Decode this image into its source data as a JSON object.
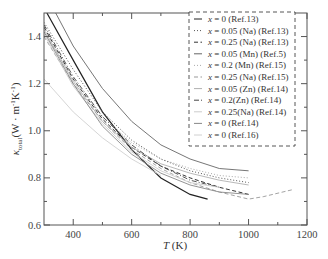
{
  "chart_data": {
    "type": "line",
    "title": "",
    "xlabel": "T (K)",
    "xlabel_italic": "T",
    "xlabel_unit": " (K)",
    "ylabel": "κ_total (W·m⁻¹K⁻¹)",
    "ylabel_parts": {
      "kappa": "κ",
      "sub": "total",
      "unit": "(W · m",
      "exp1": "-1",
      "k": "K",
      "exp2": "-1",
      "close": ")"
    },
    "xlim": [
      300,
      1200
    ],
    "ylim": [
      0.6,
      1.5
    ],
    "xticks": [
      400,
      600,
      800,
      1000,
      1200
    ],
    "xminor": [
      500,
      700,
      900,
      1100
    ],
    "yticks": [
      0.6,
      0.8,
      1.0,
      1.2,
      1.4
    ],
    "yminor": [
      0.7,
      0.9,
      1.1,
      1.3
    ],
    "grid": false,
    "legend_position": "upper right (dashed box)",
    "series": [
      {
        "name": "x = 0 (Ref.13)",
        "style": "solid",
        "color": "#222222",
        "width": 1.2,
        "x": [
          310,
          400,
          500,
          600,
          700,
          800,
          860
        ],
        "y": [
          1.5,
          1.3,
          1.08,
          0.92,
          0.8,
          0.73,
          0.71
        ]
      },
      {
        "name": "x = 0.05 (Na) (Ref.13)",
        "style": "dotted",
        "color": "#555555",
        "width": 1.0,
        "x": [
          300,
          400,
          500,
          600,
          700,
          800,
          900,
          1000
        ],
        "y": [
          1.46,
          1.26,
          1.08,
          0.96,
          0.88,
          0.83,
          0.8,
          0.78
        ]
      },
      {
        "name": "x = 0.25 (Na) (Ref.13)",
        "style": "dashed",
        "color": "#333333",
        "width": 1.0,
        "x": [
          300,
          400,
          500,
          600,
          700,
          800,
          900,
          1000
        ],
        "y": [
          1.44,
          1.22,
          1.05,
          0.93,
          0.85,
          0.8,
          0.76,
          0.73
        ]
      },
      {
        "name": "x = 0.05 (Mn) (Ref.5)",
        "style": "solid",
        "color": "#666666",
        "width": 0.9,
        "x": [
          340,
          400,
          500,
          600,
          700,
          800,
          900,
          1000
        ],
        "y": [
          1.5,
          1.36,
          1.18,
          1.04,
          0.94,
          0.88,
          0.84,
          0.83
        ]
      },
      {
        "name": "x = 0.2 (Mn) (Ref.15)",
        "style": "dotted",
        "color": "#aaaaaa",
        "width": 1.0,
        "x": [
          300,
          400,
          500,
          600,
          700,
          800,
          900,
          1000
        ],
        "y": [
          1.42,
          1.22,
          1.06,
          0.95,
          0.88,
          0.84,
          0.81,
          0.8
        ]
      },
      {
        "name": "x = 0.25 (Na) (Ref.15)",
        "style": "dashed",
        "color": "#999999",
        "width": 0.9,
        "x": [
          300,
          400,
          500,
          600,
          700,
          800,
          900,
          1000,
          1050,
          1150
        ],
        "y": [
          1.4,
          1.2,
          1.04,
          0.92,
          0.84,
          0.78,
          0.74,
          0.71,
          0.72,
          0.75
        ]
      },
      {
        "name": "x = 0.05 (Zn) (Ref.14)",
        "style": "solid",
        "color": "#b0b0b0",
        "width": 0.9,
        "x": [
          300,
          400,
          500,
          600,
          700,
          800,
          900,
          1000
        ],
        "y": [
          1.43,
          1.21,
          1.04,
          0.93,
          0.86,
          0.82,
          0.79,
          0.77
        ]
      },
      {
        "name": "x = 0.2(Zn) (Ref.14)",
        "style": "dashdot",
        "color": "#444444",
        "width": 0.9,
        "x": [
          300,
          400,
          500,
          600,
          700,
          800,
          900
        ],
        "y": [
          1.45,
          1.23,
          1.06,
          0.94,
          0.85,
          0.79,
          0.76
        ]
      },
      {
        "name": "x = 0.25(Na) (Ref.14)",
        "style": "solid",
        "color": "#cccccc",
        "width": 0.9,
        "x": [
          300,
          400,
          500,
          600,
          700,
          800,
          900
        ],
        "y": [
          1.41,
          1.19,
          1.03,
          0.91,
          0.83,
          0.78,
          0.76
        ]
      },
      {
        "name": "x = 0 (Ref.14)",
        "style": "solid",
        "color": "#888888",
        "width": 0.9,
        "x": [
          300,
          400,
          500,
          600,
          700,
          800,
          900,
          1000
        ],
        "y": [
          1.42,
          1.2,
          1.02,
          0.9,
          0.82,
          0.77,
          0.74,
          0.73
        ]
      },
      {
        "name": "x = 0 (Ref.16)",
        "style": "solid",
        "color": "#d0d0d0",
        "width": 0.9,
        "x": [
          300,
          400,
          500,
          600,
          700
        ],
        "y": [
          1.22,
          1.08,
          0.97,
          0.88,
          0.81
        ]
      }
    ]
  },
  "legend": {
    "items": [
      {
        "label": "x = 0 (Ref.13)"
      },
      {
        "label": "x = 0.05 (Na)  (Ref.13)"
      },
      {
        "label": "x = 0.25 (Na) (Ref.13)"
      },
      {
        "label": "x = 0.05 (Mn) (Ref.5)"
      },
      {
        "label": "x = 0.2 (Mn) (Ref.15)"
      },
      {
        "label": "x = 0.25 (Na) (Ref.15)"
      },
      {
        "label": "x = 0.05 (Zn) (Ref.14)"
      },
      {
        "label": "x = 0.2(Zn) (Ref.14)"
      },
      {
        "label": "x = 0.25(Na) (Ref.14)"
      },
      {
        "label": "x = 0 (Ref.14)"
      },
      {
        "label": "x = 0 (Ref.16)"
      }
    ]
  },
  "tick_labels": {
    "x": [
      "400",
      "600",
      "800",
      "1000",
      "1200"
    ],
    "y": [
      "0.6",
      "0.8",
      "1.0",
      "1.2",
      "1.4"
    ]
  }
}
